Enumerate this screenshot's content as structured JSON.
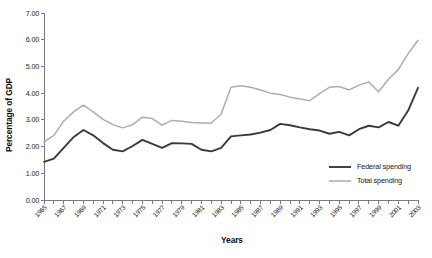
{
  "chart_data": {
    "type": "line",
    "title": "",
    "xlabel": "Years",
    "ylabel": "Percentage of GDP",
    "xlim": [
      1965,
      2003
    ],
    "ylim": [
      0.0,
      7.0
    ],
    "ytick_labels": [
      "0.00",
      "1.00",
      "2.00",
      "3.00",
      "4.00",
      "5.00",
      "6.00",
      "7.00"
    ],
    "ytick_values": [
      0.0,
      1.0,
      2.0,
      3.0,
      4.0,
      5.0,
      6.0,
      7.0
    ],
    "xtick_labels": [
      "1965",
      "1967",
      "1969",
      "1971",
      "1973",
      "1975",
      "1977",
      "1979",
      "1981",
      "1983",
      "1985",
      "1987",
      "1989",
      "1991",
      "1993",
      "1995",
      "1997",
      "1999",
      "2001",
      "2003"
    ],
    "x": [
      1965,
      1966,
      1967,
      1968,
      1969,
      1970,
      1971,
      1972,
      1973,
      1974,
      1975,
      1976,
      1977,
      1978,
      1979,
      1980,
      1981,
      1982,
      1983,
      1984,
      1985,
      1986,
      1987,
      1988,
      1989,
      1990,
      1991,
      1992,
      1993,
      1994,
      1995,
      1996,
      1997,
      1998,
      1999,
      2000,
      2001,
      2002,
      2003
    ],
    "grid": false,
    "legend_position": "bottom-right",
    "series": [
      {
        "name": "Federal spending",
        "color": "#3a3a3a",
        "values": [
          1.43,
          1.55,
          1.95,
          2.35,
          2.62,
          2.42,
          2.13,
          1.88,
          1.82,
          2.02,
          2.25,
          2.1,
          1.95,
          2.13,
          2.12,
          2.1,
          1.88,
          1.82,
          1.95,
          2.38,
          2.42,
          2.45,
          2.52,
          2.62,
          2.85,
          2.8,
          2.72,
          2.65,
          2.6,
          2.48,
          2.55,
          2.42,
          2.65,
          2.78,
          2.72,
          2.92,
          2.78,
          3.35,
          4.2
        ]
      },
      {
        "name": "Total spending",
        "color": "#adadad",
        "values": [
          2.18,
          2.42,
          2.95,
          3.3,
          3.55,
          3.3,
          3.02,
          2.82,
          2.7,
          2.82,
          3.1,
          3.05,
          2.8,
          2.98,
          2.95,
          2.9,
          2.88,
          2.88,
          3.22,
          4.22,
          4.28,
          4.22,
          4.12,
          4.0,
          3.95,
          3.85,
          3.78,
          3.72,
          3.98,
          4.22,
          4.25,
          4.12,
          4.3,
          4.42,
          4.05,
          4.52,
          4.88,
          5.48,
          5.98
        ]
      }
    ]
  },
  "legend": {
    "items": [
      {
        "label": "Federal spending",
        "color": "#3a3a3a"
      },
      {
        "label": "Total spending",
        "color": "#adadad"
      }
    ]
  }
}
